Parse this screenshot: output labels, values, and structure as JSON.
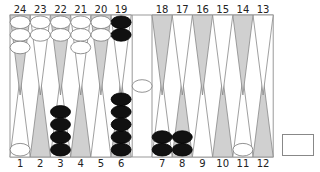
{
  "board": {
    "top_labels": [
      "24",
      "23",
      "22",
      "21",
      "20",
      "19",
      "18",
      "17",
      "16",
      "15",
      "14",
      "13"
    ],
    "bottom_labels": [
      "1",
      "2",
      "3",
      "4",
      "5",
      "6",
      "7",
      "8",
      "9",
      "10",
      "11",
      "12"
    ],
    "colors": {
      "light_point": "#ffffff",
      "dark_point": "#d0d0d0",
      "point_outline": "#888888",
      "white_checker": "#ffffff",
      "black_checker": "#111111",
      "frame": "#999999"
    },
    "positions": {
      "24": {
        "color": "white",
        "count": 3
      },
      "23": {
        "color": "white",
        "count": 2
      },
      "22": {
        "color": "white",
        "count": 2
      },
      "21": {
        "color": "white",
        "count": 3
      },
      "20": {
        "color": "white",
        "count": 2
      },
      "19": {
        "color": "black",
        "count": 2
      },
      "1": {
        "color": "white",
        "count": 1
      },
      "3": {
        "color": "black",
        "count": 4
      },
      "6": {
        "color": "black",
        "count": 5
      },
      "7": {
        "color": "black",
        "count": 2
      },
      "8": {
        "color": "black",
        "count": 2
      },
      "11": {
        "color": "white",
        "count": 1
      }
    },
    "bar": {
      "white": 1
    },
    "doubling_cube": {
      "value": ""
    }
  }
}
